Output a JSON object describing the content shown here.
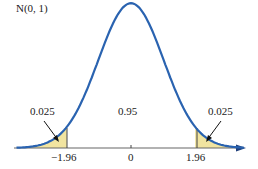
{
  "chart_data": {
    "type": "area",
    "title": "N(0, 1)",
    "distribution": "standard normal",
    "x_ticks": [
      {
        "value": -1.96,
        "label": "−1.96"
      },
      {
        "value": 0,
        "label": "0"
      },
      {
        "value": 1.96,
        "label": "1.96"
      }
    ],
    "regions": [
      {
        "name": "left tail",
        "range": [
          null,
          -1.96
        ],
        "area": 0.025,
        "label": "0.025",
        "shaded": true
      },
      {
        "name": "center",
        "range": [
          -1.96,
          1.96
        ],
        "area": 0.95,
        "label": "0.95",
        "shaded": false
      },
      {
        "name": "right tail",
        "range": [
          1.96,
          null
        ],
        "area": 0.025,
        "label": "0.025",
        "shaded": true
      }
    ],
    "colors": {
      "curve": "#2a63b0",
      "shade": "#f1e4a0",
      "axis": "#555555"
    }
  },
  "labels": {
    "title": "N(0, 1)",
    "left_area": "0.025",
    "center_area": "0.95",
    "right_area": "0.025",
    "tick_left": "−1.96",
    "tick_center": "0",
    "tick_right": "1.96"
  }
}
